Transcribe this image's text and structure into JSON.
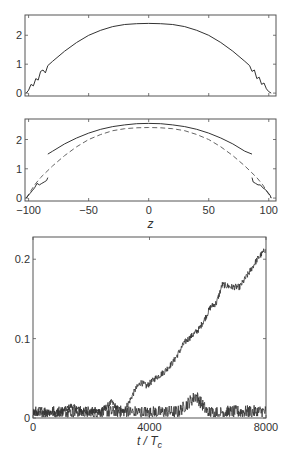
{
  "chart_data": [
    {
      "type": "line",
      "panel": "top",
      "title": "",
      "xlabel": "",
      "ylabel": "",
      "xlim": [
        -103,
        106
      ],
      "ylim": [
        -0.1,
        2.7
      ],
      "yticks": [
        0,
        1,
        2
      ],
      "ytick_labels": [
        "0",
        "1",
        "2"
      ],
      "xticks": [
        -100,
        -50,
        0,
        50,
        100
      ],
      "xtick_labels": [],
      "grid": false,
      "series": [
        {
          "name": "profile",
          "style": "solid",
          "description": "Thomas-Fermi-like parabolic density profile peaking ~2.4 at z=0, with small oscillations near the edges",
          "x": [
            -102,
            -100,
            -98,
            -96,
            -94,
            -92,
            -90,
            -88,
            -86,
            -84,
            -80,
            -70,
            -60,
            -50,
            -40,
            -30,
            -20,
            -10,
            0,
            10,
            20,
            30,
            40,
            50,
            60,
            70,
            80,
            84,
            86,
            88,
            90,
            92,
            94,
            96,
            98,
            100,
            102
          ],
          "y": [
            0.0,
            0.1,
            0.3,
            0.25,
            0.5,
            0.45,
            0.75,
            0.8,
            0.7,
            0.95,
            1.1,
            1.45,
            1.75,
            2.0,
            2.17,
            2.3,
            2.37,
            2.4,
            2.41,
            2.4,
            2.37,
            2.3,
            2.17,
            2.0,
            1.75,
            1.45,
            1.1,
            0.95,
            0.75,
            0.8,
            0.5,
            0.55,
            0.3,
            0.35,
            0.15,
            0.05,
            0.0
          ]
        }
      ]
    },
    {
      "type": "line",
      "panel": "middle",
      "title": "",
      "xlabel": "z",
      "ylabel": "",
      "xlim": [
        -103,
        106
      ],
      "ylim": [
        -0.1,
        2.7
      ],
      "yticks": [
        0,
        1,
        2
      ],
      "ytick_labels": [
        "0",
        "1",
        "2"
      ],
      "xticks": [
        -100,
        -50,
        0,
        50,
        100
      ],
      "xtick_labels": [
        "-100",
        "-50",
        "0",
        "50",
        "100"
      ],
      "grid": false,
      "series": [
        {
          "name": "solid-core",
          "style": "solid",
          "x": [
            -84,
            -80,
            -70,
            -60,
            -50,
            -40,
            -30,
            -20,
            -10,
            0,
            10,
            20,
            30,
            40,
            50,
            60,
            70,
            80,
            86
          ],
          "y": [
            1.5,
            1.6,
            1.85,
            2.05,
            2.22,
            2.35,
            2.44,
            2.5,
            2.54,
            2.55,
            2.54,
            2.5,
            2.44,
            2.35,
            2.22,
            2.05,
            1.85,
            1.6,
            1.5
          ]
        },
        {
          "name": "dashed-reference",
          "style": "dashed",
          "x": [
            -102,
            -95,
            -90,
            -80,
            -70,
            -60,
            -50,
            -40,
            -30,
            -20,
            -10,
            0,
            10,
            20,
            30,
            40,
            50,
            60,
            70,
            80,
            90,
            95,
            102
          ],
          "y": [
            0.0,
            0.45,
            0.7,
            1.1,
            1.45,
            1.75,
            2.0,
            2.17,
            2.3,
            2.37,
            2.4,
            2.41,
            2.4,
            2.37,
            2.3,
            2.17,
            2.0,
            1.75,
            1.45,
            1.1,
            0.7,
            0.45,
            0.0
          ]
        },
        {
          "name": "left-edge-solid",
          "style": "solid",
          "x": [
            -102,
            -99,
            -97,
            -95,
            -93,
            -91,
            -89,
            -87,
            -85,
            -84
          ],
          "y": [
            0.0,
            0.15,
            0.25,
            0.35,
            0.5,
            0.45,
            0.5,
            0.55,
            0.6,
            0.7
          ]
        },
        {
          "name": "right-edge-solid",
          "style": "solid",
          "x": [
            86,
            87,
            89,
            91,
            93,
            95,
            97,
            99,
            101,
            102
          ],
          "y": [
            0.7,
            0.55,
            0.5,
            0.45,
            0.45,
            0.35,
            0.3,
            0.2,
            0.1,
            0.0
          ]
        }
      ]
    },
    {
      "type": "line",
      "panel": "bottom",
      "title": "",
      "xlabel": "t / T_c",
      "xlabel_main": "t / T",
      "xlabel_sub": "c",
      "ylabel": "",
      "xlim": [
        0,
        8000
      ],
      "ylim": [
        0,
        0.228
      ],
      "yticks": [
        0,
        0.1,
        0.2
      ],
      "ytick_labels": [
        "0",
        "0.1",
        "0.2"
      ],
      "xticks": [
        0,
        4000,
        8000
      ],
      "xtick_labels": [
        "0",
        "4000",
        "8000"
      ],
      "grid": false,
      "series": [
        {
          "name": "growing-signal",
          "style": "solid-noisy",
          "x": [
            0,
            500,
            1000,
            1300,
            1500,
            1700,
            2000,
            2400,
            2700,
            2900,
            3100,
            3300,
            3500,
            3700,
            3900,
            4200,
            4500,
            4800,
            5000,
            5200,
            5500,
            5700,
            5900,
            6100,
            6300,
            6500,
            6800,
            7100,
            7400,
            7700,
            8000
          ],
          "y": [
            0.005,
            0.007,
            0.008,
            0.015,
            0.012,
            0.008,
            0.007,
            0.01,
            0.02,
            0.012,
            0.008,
            0.02,
            0.035,
            0.045,
            0.04,
            0.05,
            0.058,
            0.07,
            0.082,
            0.095,
            0.105,
            0.112,
            0.125,
            0.14,
            0.145,
            0.168,
            0.165,
            0.165,
            0.182,
            0.2,
            0.213
          ]
        },
        {
          "name": "baseline-noise",
          "style": "solid-noisy",
          "x": [
            0,
            1000,
            2000,
            3000,
            4000,
            5000,
            5600,
            6000,
            7000,
            8000
          ],
          "y": [
            0.007,
            0.008,
            0.007,
            0.008,
            0.007,
            0.008,
            0.028,
            0.007,
            0.008,
            0.008
          ],
          "noise_amplitude": 0.008
        }
      ]
    }
  ]
}
